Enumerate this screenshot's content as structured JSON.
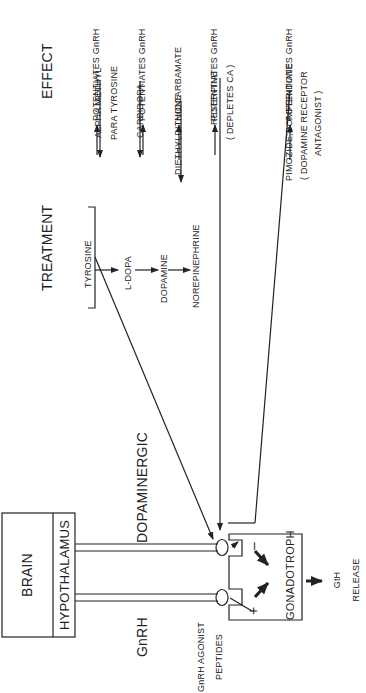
{
  "headers": {
    "treatment": "TREATMENT",
    "effect": "EFFECT"
  },
  "brain": {
    "brain_label": "BRAIN",
    "hypothalamus_label": "HYPOTHALAMUS"
  },
  "pathways": {
    "gnrh": "GnRH",
    "dopaminergic": "DOPAMINERGIC"
  },
  "pituitary": {
    "cell_label": "GONADOTROPH",
    "plus": "+",
    "minus": "–",
    "output": "GtH",
    "output_action": "RELEASE"
  },
  "agonist": {
    "line1": "GnRH AGONIST",
    "line2": "PEPTIDES"
  },
  "synthesis": {
    "steps": [
      "TYROSINE",
      "L-DOPA",
      "DOPAMINE",
      "NOREPINEPHRINE"
    ]
  },
  "treatments": [
    {
      "line1": "ALPHA METHYL",
      "line2": "PARA TYROSINE",
      "effect": "POTENTIATES GnRH"
    },
    {
      "line1": "CARBIDOPA",
      "line2": "",
      "effect": "POTENTIATES GnRH"
    },
    {
      "line1": "DIETHYLDITHIOCARBAMATE",
      "line2": "",
      "effect": "NONE"
    },
    {
      "line1": "RESERPINE",
      "line2": "( DEPLETES CA )",
      "effect": "POTENTIATES GnRH"
    },
    {
      "line1": "PIMOZIDE;DOMPERIDONE",
      "line2": "( DOPAMINE RECEPTOR",
      "line3": "ANTAGONIST )",
      "effect": "POTENTIATES GnRH"
    }
  ],
  "colors": {
    "ink": "#222222",
    "background": "#ffffff"
  }
}
